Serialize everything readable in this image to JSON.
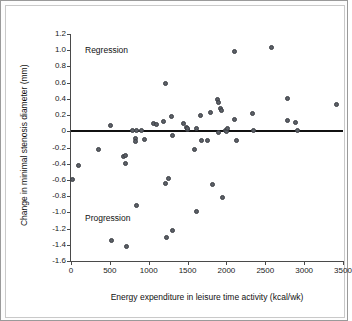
{
  "chart_data": {
    "type": "scatter",
    "title": "",
    "xlabel": "Energy expenditure in leisure time activity (kcal/wk)",
    "ylabel": "Change in minimal stenosis diameter (mm)",
    "xlim": [
      0,
      3500
    ],
    "ylim": [
      -1.6,
      1.2
    ],
    "xticks": [
      "0",
      "500",
      "1000",
      "1500",
      "2000",
      "2500",
      "3000",
      "3500"
    ],
    "yticks": [
      "1.2",
      "1.0",
      "0.8",
      "0.6",
      "0.4",
      "0.2",
      "0",
      "-0.2",
      "-0.4",
      "-0.6",
      "-0.8",
      "-1.0",
      "-1.2",
      "-1.4",
      "-1.6"
    ],
    "grid": false,
    "legend": "none",
    "reference_line": {
      "y": 0,
      "color": "#111111"
    },
    "marker_color": "#5b5f66",
    "annotations": [
      {
        "text": "Regression",
        "x": 260,
        "y": 1.0
      },
      {
        "text": "Progression",
        "x": 260,
        "y": -1.13
      }
    ],
    "points": [
      {
        "x": 20,
        "y": -0.59
      },
      {
        "x": 95,
        "y": -0.42
      },
      {
        "x": 360,
        "y": -0.23
      },
      {
        "x": 505,
        "y": 0.07
      },
      {
        "x": 520,
        "y": -1.35
      },
      {
        "x": 675,
        "y": -0.31
      },
      {
        "x": 700,
        "y": -0.3
      },
      {
        "x": 700,
        "y": -0.4
      },
      {
        "x": 715,
        "y": -1.42
      },
      {
        "x": 790,
        "y": 0.01
      },
      {
        "x": 825,
        "y": -0.09
      },
      {
        "x": 830,
        "y": -0.13
      },
      {
        "x": 840,
        "y": 0.01
      },
      {
        "x": 845,
        "y": -0.91
      },
      {
        "x": 910,
        "y": 0.01
      },
      {
        "x": 945,
        "y": -0.1
      },
      {
        "x": 1065,
        "y": 0.09
      },
      {
        "x": 1100,
        "y": 0.08
      },
      {
        "x": 1190,
        "y": 0.12
      },
      {
        "x": 1215,
        "y": -0.65
      },
      {
        "x": 1220,
        "y": 0.59
      },
      {
        "x": 1235,
        "y": -1.31
      },
      {
        "x": 1255,
        "y": -0.58
      },
      {
        "x": 1290,
        "y": 0.18
      },
      {
        "x": 1300,
        "y": -1.22
      },
      {
        "x": 1310,
        "y": -0.05
      },
      {
        "x": 1450,
        "y": 0.1
      },
      {
        "x": 1490,
        "y": 0.05
      },
      {
        "x": 1500,
        "y": 0.02
      },
      {
        "x": 1505,
        "y": 0.03
      },
      {
        "x": 1590,
        "y": -0.22
      },
      {
        "x": 1610,
        "y": 0.03
      },
      {
        "x": 1615,
        "y": -0.99
      },
      {
        "x": 1670,
        "y": 0.19
      },
      {
        "x": 1680,
        "y": -0.11
      },
      {
        "x": 1750,
        "y": -0.11
      },
      {
        "x": 1800,
        "y": 0.23
      },
      {
        "x": 1815,
        "y": -0.66
      },
      {
        "x": 1890,
        "y": 0.39
      },
      {
        "x": 1895,
        "y": 0.35
      },
      {
        "x": 1900,
        "y": -0.02
      },
      {
        "x": 1930,
        "y": 0.28
      },
      {
        "x": 1940,
        "y": 0.26
      },
      {
        "x": 1955,
        "y": -0.82
      },
      {
        "x": 1985,
        "y": 0.01
      },
      {
        "x": 2000,
        "y": 0.0
      },
      {
        "x": 2010,
        "y": 0.04
      },
      {
        "x": 2100,
        "y": 0.99
      },
      {
        "x": 2110,
        "y": 0.14
      },
      {
        "x": 2125,
        "y": -0.11
      },
      {
        "x": 2330,
        "y": 0.22
      },
      {
        "x": 2350,
        "y": 0.01
      },
      {
        "x": 2580,
        "y": 1.03
      },
      {
        "x": 2780,
        "y": 0.4
      },
      {
        "x": 2790,
        "y": 0.13
      },
      {
        "x": 2890,
        "y": 0.11
      },
      {
        "x": 2910,
        "y": 0.01
      },
      {
        "x": 3420,
        "y": 0.33
      }
    ]
  }
}
